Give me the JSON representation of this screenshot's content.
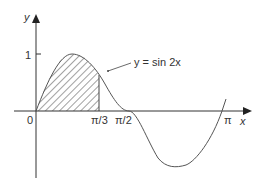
{
  "diagram": {
    "function_label": "y = sin 2x",
    "axes": {
      "x_label": "x",
      "y_label": "y"
    },
    "ticks": {
      "origin": "0",
      "y_one": "1",
      "pi_over_3": "π/3",
      "pi_over_2": "π/2",
      "pi": "π"
    },
    "shaded_region": {
      "from": "0",
      "to": "π/3",
      "style": "hatched"
    },
    "colors": {
      "curve": "#555555",
      "axes": "#333333",
      "hatch": "#444444"
    }
  }
}
